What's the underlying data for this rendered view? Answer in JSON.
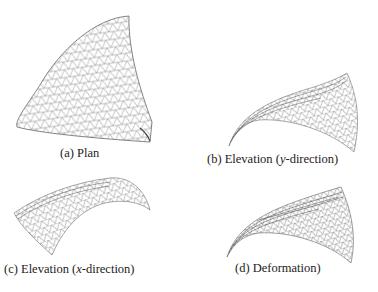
{
  "figure": {
    "panels": [
      {
        "id": "a",
        "label": "(a)",
        "title": "Plan",
        "view": "plan"
      },
      {
        "id": "b",
        "label": "(b)",
        "title_pre": "Elevation (",
        "title_var": "y",
        "title_post": "-direction)",
        "view": "elevation-y"
      },
      {
        "id": "c",
        "label": "(c)",
        "title_pre": "Elevation (",
        "title_var": "x",
        "title_post": "-direction)",
        "view": "elevation-x"
      },
      {
        "id": "d",
        "label": "(d)",
        "title": "Deformation)",
        "view": "deformation"
      }
    ],
    "mesh": {
      "type": "triangular-grid",
      "stroke_color": "#555555"
    }
  }
}
